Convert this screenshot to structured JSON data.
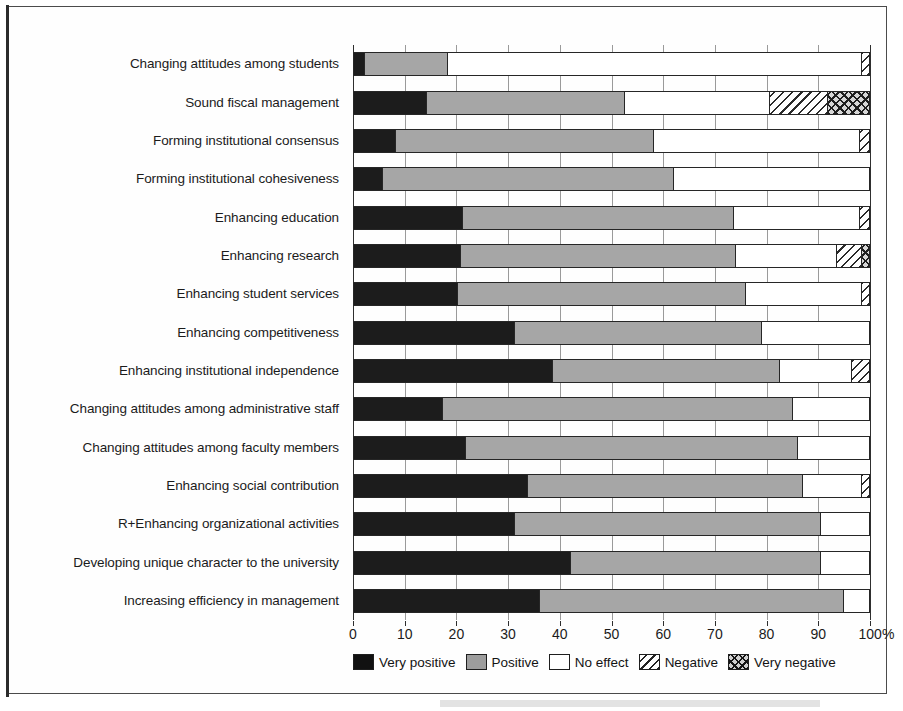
{
  "figure": {
    "background_color": "#ffffff",
    "frame_color": "#4b4b4b"
  },
  "chart_data": {
    "type": "bar",
    "orientation": "horizontal",
    "stacked": true,
    "normalized_percent": true,
    "title": "",
    "subtitle": "",
    "xlabel": "",
    "ylabel": "",
    "xlim": [
      0,
      100
    ],
    "grid": true,
    "grid_axis": "x",
    "legend_position": "bottom",
    "xtick_labels": [
      "0",
      "10",
      "20",
      "30",
      "40",
      "50",
      "60",
      "70",
      "80",
      "90",
      "100%"
    ],
    "xtick_values": [
      0,
      10,
      20,
      30,
      40,
      50,
      60,
      70,
      80,
      90,
      100
    ],
    "categories": [
      "Changing attitudes among students",
      "Sound fiscal management",
      "Forming institutional consensus",
      "Forming institutional cohesiveness",
      "Enhancing education",
      "Enhancing research",
      "Enhancing student services",
      "Enhancing competitiveness",
      "Enhancing institutional independence",
      "Changing attitudes among administrative staff",
      "Changing attitudes among faculty members",
      "Enhancing social contribution",
      "R+Enhancing organizational activities",
      "Developing unique character to the university",
      "Increasing efficiency in management"
    ],
    "series": [
      {
        "name": "Very positive",
        "color": "#1c1c1c",
        "pattern": "solid-black",
        "values": [
          2,
          14,
          8,
          5.5,
          21,
          20.5,
          20,
          31,
          38.5,
          17,
          21.5,
          33.5,
          31,
          42,
          36
        ]
      },
      {
        "name": "Positive",
        "color": "#a6a6a6",
        "pattern": "solid-gray",
        "values": [
          16,
          38.5,
          50,
          56.5,
          52.5,
          53.5,
          56,
          48,
          44,
          68,
          64.5,
          53.5,
          59.5,
          48.5,
          59
        ]
      },
      {
        "name": "No effect",
        "color": "#ffffff",
        "pattern": "white",
        "values": [
          80.5,
          28.1,
          40,
          38,
          24.5,
          19.5,
          22.5,
          21,
          14,
          15,
          14,
          11.5,
          9.5,
          9.5,
          5
        ]
      },
      {
        "name": "Negative",
        "color": "#ffffff",
        "pattern": "diagonal-hatch",
        "values": [
          1.5,
          11.3,
          2,
          0,
          2,
          5,
          1.5,
          0,
          3.5,
          0,
          0,
          1.5,
          0,
          0,
          0
        ]
      },
      {
        "name": "Very negative",
        "color": "#d6d6d6",
        "pattern": "cross-hatch",
        "values": [
          0,
          8.1,
          0,
          0,
          0,
          1.5,
          0,
          0,
          0,
          0,
          0,
          0,
          0,
          0,
          0
        ]
      }
    ]
  },
  "legend": {
    "items": [
      {
        "label": "Very positive",
        "swatch": "vpos"
      },
      {
        "label": "Positive",
        "swatch": "pos"
      },
      {
        "label": "No effect",
        "swatch": "noeff"
      },
      {
        "label": "Negative",
        "swatch": "neg"
      },
      {
        "label": "Very negative",
        "swatch": "vneg"
      }
    ]
  }
}
